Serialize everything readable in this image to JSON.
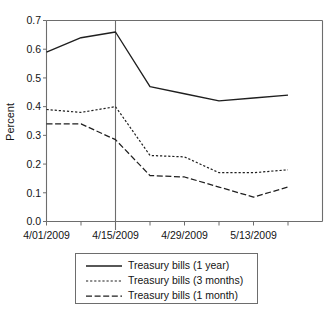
{
  "chart_data": {
    "type": "line",
    "title": "",
    "subtitle": "",
    "xlabel": "",
    "ylabel": "Percent",
    "xlim": [
      0,
      8
    ],
    "ylim": [
      0.0,
      0.7
    ],
    "grid": false,
    "legend_position": "bottom",
    "x_tick_labels": [
      "4/01/2009",
      "4/15/2009",
      "4/29/2009",
      "5/13/2009"
    ],
    "x_tick_positions": [
      0,
      2,
      4,
      6
    ],
    "x_minor_tick_positions": [
      0,
      1,
      2,
      3,
      4,
      5,
      6,
      7
    ],
    "y_tick_labels": [
      "0.0",
      "0.1",
      "0.2",
      "0.3",
      "0.4",
      "0.5",
      "0.6",
      "0.7"
    ],
    "y_tick_values": [
      0.0,
      0.1,
      0.2,
      0.3,
      0.4,
      0.5,
      0.6,
      0.7
    ],
    "x": [
      0,
      1,
      2,
      3,
      4,
      5,
      6,
      7
    ],
    "annotations": [
      {
        "name": "vertical-reference-line",
        "type": "vline",
        "x": 2,
        "label": "4/15/2009"
      }
    ],
    "series": [
      {
        "name": "Treasury bills (1 year)",
        "style": "solid",
        "values": [
          0.59,
          0.64,
          0.66,
          0.47,
          0.445,
          0.42,
          0.43,
          0.44
        ]
      },
      {
        "name": "Treasury bills (3 months)",
        "style": "dotted",
        "values": [
          0.39,
          0.38,
          0.4,
          0.23,
          0.225,
          0.17,
          0.17,
          0.18
        ]
      },
      {
        "name": "Treasury bills (1 month)",
        "style": "dashed",
        "values": [
          0.34,
          0.34,
          0.285,
          0.16,
          0.155,
          0.12,
          0.085,
          0.12
        ]
      }
    ]
  },
  "legend": {
    "items": [
      {
        "label": "Treasury bills (1 year)",
        "style": "solid"
      },
      {
        "label": "Treasury bills (3 months)",
        "style": "dotted"
      },
      {
        "label": "Treasury bills (1 month)",
        "style": "dashed"
      }
    ]
  }
}
